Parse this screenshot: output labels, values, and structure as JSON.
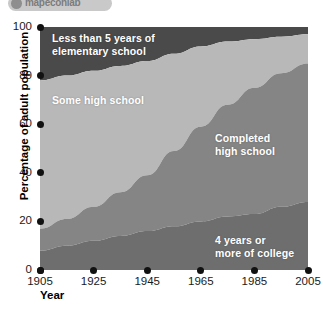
{
  "logo": {
    "text": "mapeconlab",
    "badge_icon": "globe-icon"
  },
  "chart_data": {
    "type": "area",
    "stacked": true,
    "title": "",
    "xlabel": "Year",
    "ylabel": "Percentage of adult population",
    "xlim": [
      1905,
      2005
    ],
    "ylim": [
      0,
      100
    ],
    "grid": false,
    "legend_position": "in-plot",
    "x": [
      1905,
      1915,
      1925,
      1935,
      1945,
      1955,
      1965,
      1975,
      1985,
      1995,
      2005
    ],
    "xticks": [
      1905,
      1925,
      1945,
      1965,
      1985,
      2005
    ],
    "yticks": [
      0,
      20,
      40,
      60,
      80,
      100
    ],
    "series": [
      {
        "name": "Less than 5 years of elementary school",
        "color": "#4a4a4a",
        "values": [
          22,
          20,
          18,
          16,
          14,
          11,
          8,
          6,
          5,
          4,
          3
        ]
      },
      {
        "name": "Some high school",
        "color": "#b8b8b8",
        "values": [
          61,
          59,
          56,
          52,
          47,
          40,
          33,
          26,
          20,
          15,
          12
        ]
      },
      {
        "name": "Completed high school",
        "color": "#858585",
        "values": [
          9,
          11,
          14,
          18,
          23,
          31,
          39,
          46,
          52,
          55,
          57
        ]
      },
      {
        "name": "4 years or more of college",
        "color": "#6e6e6e",
        "values": [
          8,
          10,
          12,
          14,
          16,
          18,
          20,
          22,
          23,
          26,
          28
        ]
      }
    ]
  }
}
